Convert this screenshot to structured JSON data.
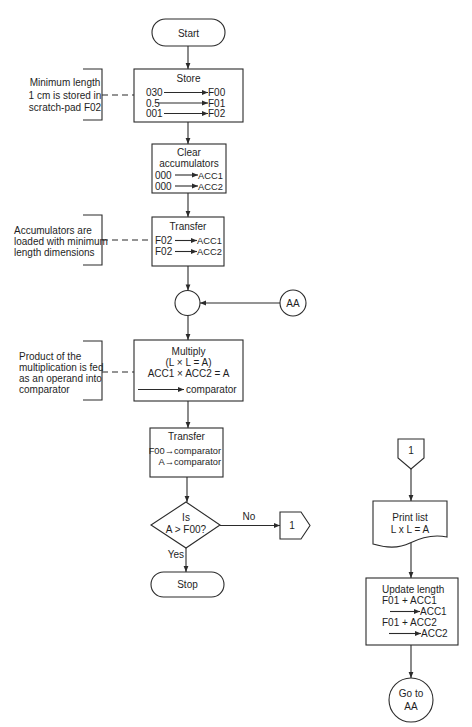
{
  "diagram": {
    "main": {
      "start": {
        "label": "Start"
      },
      "store": {
        "title": "Store",
        "rows": [
          {
            "from": "030",
            "to": "F00"
          },
          {
            "from": "0.5",
            "to": "F01"
          },
          {
            "from": "001",
            "to": "F02"
          }
        ]
      },
      "clear": {
        "title_line1": "Clear",
        "title_line2": "accumulators",
        "rows": [
          {
            "from": "000",
            "to": "ACC1"
          },
          {
            "from": "000",
            "to": "ACC2"
          }
        ]
      },
      "transfer_load": {
        "title": "Transfer",
        "rows": [
          {
            "from": "F02",
            "to": "ACC1"
          },
          {
            "from": "F02",
            "to": "ACC2"
          }
        ]
      },
      "junction": {
        "incoming_connector": "AA"
      },
      "multiply": {
        "title": "Multiply",
        "formula": "(L × L = A)",
        "operation": "ACC1  × ACC2 = A",
        "output_target": "comparator"
      },
      "transfer_compare": {
        "title": "Transfer",
        "lines": [
          "F00→comparator",
          "A→comparator"
        ]
      },
      "decision": {
        "line1": "Is",
        "line2": "A > F00?",
        "no_label": "No",
        "yes_label": "Yes"
      },
      "offpage_out": {
        "label": "1"
      },
      "stop": {
        "label": "Stop"
      }
    },
    "annotations": [
      {
        "lines": [
          "Minimum length",
          "1 cm is stored in",
          "scratch-pad F02"
        ]
      },
      {
        "lines": [
          "Accumulators are",
          "loaded with minimum",
          "length dimensions"
        ]
      },
      {
        "lines": [
          "Product of the",
          "multiplication is fed",
          "as an operand into",
          "comparator"
        ]
      }
    ],
    "subroutine": {
      "offpage_in": {
        "label": "1"
      },
      "print_list": {
        "line1": "Print list",
        "line2": "L x L = A"
      },
      "update_length": {
        "title": "Update length",
        "line1": "F01 + ACC1",
        "target1": "ACC1",
        "line2": "F01 + ACC2",
        "target2": "ACC2"
      },
      "goto": {
        "line1": "Go to",
        "line2": "AA"
      }
    },
    "colors": {
      "stroke": "#2b2b2b",
      "text": "#1e1e1e",
      "background": "#ffffff"
    }
  }
}
